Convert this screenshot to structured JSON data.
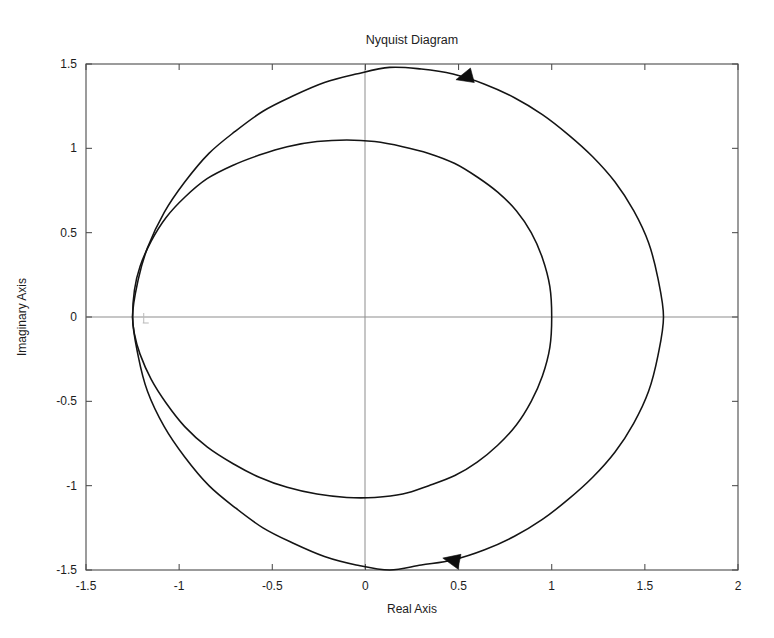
{
  "figure": {
    "name": "nyquist-figure",
    "background_color": "#ffffff",
    "curve_color": "#141414",
    "frame_color": "#4a4a4a",
    "zero_line_color": "#8d8d8d"
  },
  "chart_data": {
    "type": "line",
    "title": "Nyquist Diagram",
    "xlabel": "Real Axis",
    "ylabel": "Imaginary Axis",
    "xlim": [
      -1.5,
      2
    ],
    "ylim": [
      -1.5,
      1.5
    ],
    "grid": false,
    "legend": null,
    "xticks": [
      -1.5,
      -1,
      -0.5,
      0,
      0.5,
      1,
      1.5,
      2
    ],
    "xtick_labels": [
      "-1.5",
      "-1",
      "-0.5",
      "0",
      "0.5",
      "1",
      "1.5",
      "2"
    ],
    "yticks": [
      -1.5,
      -1,
      -0.5,
      0,
      0.5,
      1,
      1.5
    ],
    "ytick_labels": [
      "-1.5",
      "-1",
      "-0.5",
      "0",
      "0.5",
      "1",
      "1.5"
    ],
    "series": [
      {
        "name": "outer-locus",
        "description": "Outer Nyquist contour, crosses real axis at -1.25 and 1.60",
        "points": [
          [
            -1.25,
            0.0
          ],
          [
            -1.22,
            0.22
          ],
          [
            -1.17,
            0.41
          ],
          [
            -1.08,
            0.62
          ],
          [
            -0.97,
            0.8
          ],
          [
            -0.84,
            0.97
          ],
          [
            -0.7,
            1.1
          ],
          [
            -0.55,
            1.22
          ],
          [
            -0.39,
            1.31
          ],
          [
            -0.22,
            1.39
          ],
          [
            -0.05,
            1.44
          ],
          [
            0.13,
            1.48
          ],
          [
            0.3,
            1.47
          ],
          [
            0.47,
            1.44
          ],
          [
            0.64,
            1.38
          ],
          [
            0.8,
            1.3
          ],
          [
            0.95,
            1.2
          ],
          [
            1.09,
            1.08
          ],
          [
            1.22,
            0.95
          ],
          [
            1.34,
            0.8
          ],
          [
            1.44,
            0.63
          ],
          [
            1.52,
            0.44
          ],
          [
            1.57,
            0.23
          ],
          [
            1.6,
            0.0
          ],
          [
            1.57,
            -0.23
          ],
          [
            1.52,
            -0.44
          ],
          [
            1.44,
            -0.63
          ],
          [
            1.34,
            -0.8
          ],
          [
            1.22,
            -0.95
          ],
          [
            1.09,
            -1.08
          ],
          [
            0.95,
            -1.2
          ],
          [
            0.8,
            -1.3
          ],
          [
            0.64,
            -1.38
          ],
          [
            0.47,
            -1.44
          ],
          [
            0.3,
            -1.47
          ],
          [
            0.13,
            -1.5
          ],
          [
            -0.05,
            -1.47
          ],
          [
            -0.22,
            -1.42
          ],
          [
            -0.39,
            -1.34
          ],
          [
            -0.55,
            -1.25
          ],
          [
            -0.7,
            -1.13
          ],
          [
            -0.84,
            -1.0
          ],
          [
            -0.97,
            -0.83
          ],
          [
            -1.08,
            -0.65
          ],
          [
            -1.17,
            -0.44
          ],
          [
            -1.22,
            -0.23
          ],
          [
            -1.25,
            0.0
          ]
        ]
      },
      {
        "name": "inner-locus",
        "description": "Inner Nyquist contour, crosses real axis at -1.25 and 1.00",
        "points": [
          [
            -1.25,
            0.0
          ],
          [
            -1.24,
            0.16
          ],
          [
            -1.21,
            0.3
          ],
          [
            -1.15,
            0.45
          ],
          [
            -1.07,
            0.59
          ],
          [
            -0.97,
            0.71
          ],
          [
            -0.85,
            0.82
          ],
          [
            -0.71,
            0.9
          ],
          [
            -0.57,
            0.96
          ],
          [
            -0.42,
            1.01
          ],
          [
            -0.26,
            1.04
          ],
          [
            -0.1,
            1.05
          ],
          [
            0.05,
            1.04
          ],
          [
            0.2,
            1.01
          ],
          [
            0.34,
            0.97
          ],
          [
            0.48,
            0.91
          ],
          [
            0.6,
            0.83
          ],
          [
            0.71,
            0.74
          ],
          [
            0.81,
            0.63
          ],
          [
            0.89,
            0.5
          ],
          [
            0.95,
            0.35
          ],
          [
            0.99,
            0.18
          ],
          [
            1.0,
            0.0
          ],
          [
            0.99,
            -0.18
          ],
          [
            0.95,
            -0.35
          ],
          [
            0.89,
            -0.5
          ],
          [
            0.81,
            -0.64
          ],
          [
            0.71,
            -0.76
          ],
          [
            0.6,
            -0.86
          ],
          [
            0.48,
            -0.94
          ],
          [
            0.34,
            -1.0
          ],
          [
            0.2,
            -1.05
          ],
          [
            0.05,
            -1.07
          ],
          [
            -0.1,
            -1.07
          ],
          [
            -0.26,
            -1.05
          ],
          [
            -0.42,
            -1.01
          ],
          [
            -0.57,
            -0.95
          ],
          [
            -0.71,
            -0.87
          ],
          [
            -0.85,
            -0.77
          ],
          [
            -0.97,
            -0.65
          ],
          [
            -1.07,
            -0.51
          ],
          [
            -1.15,
            -0.37
          ],
          [
            -1.21,
            -0.22
          ],
          [
            -1.24,
            -0.1
          ],
          [
            -1.25,
            0.0
          ]
        ]
      }
    ],
    "annotations": [
      {
        "name": "direction-arrow-upper",
        "type": "arrow-head",
        "x": 0.53,
        "y": 1.42,
        "direction": "left",
        "angle_deg": 195
      },
      {
        "name": "direction-arrow-lower",
        "type": "arrow-head",
        "x": 0.46,
        "y": -1.44,
        "direction": "left",
        "angle_deg": 168
      },
      {
        "name": "critical-point-marker",
        "type": "plus-marker",
        "x": -1.19,
        "y": 0.0
      }
    ]
  }
}
